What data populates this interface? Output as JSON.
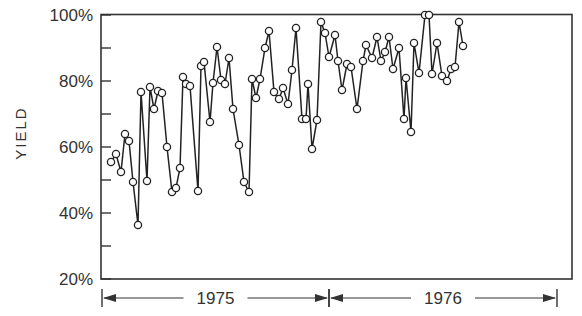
{
  "chart_data": {
    "type": "line",
    "title": "",
    "xlabel": "",
    "ylabel": "YIELD",
    "ylim": [
      20,
      100
    ],
    "yticks": [
      "20%",
      "40%",
      "60%",
      "80%",
      "100%"
    ],
    "x_periods": [
      {
        "label": "1975",
        "start_px": 102,
        "end_px": 329
      },
      {
        "label": "1976",
        "start_px": 329,
        "end_px": 557
      }
    ],
    "grid": false,
    "legend": "none",
    "marker": "open-circle",
    "series": [
      {
        "name": "Yield",
        "points_px": [
          [
            111,
            162
          ],
          [
            116,
            154
          ],
          [
            121,
            172
          ],
          [
            125,
            134
          ],
          [
            129,
            141
          ],
          [
            133,
            182
          ],
          [
            138,
            225
          ],
          [
            141,
            92
          ],
          [
            147,
            181
          ],
          [
            150,
            87
          ],
          [
            154,
            109
          ],
          [
            158,
            91
          ],
          [
            162,
            93
          ],
          [
            167,
            147
          ],
          [
            172,
            192
          ],
          [
            176,
            188
          ],
          [
            180,
            168
          ],
          [
            183,
            77
          ],
          [
            186,
            84
          ],
          [
            190,
            86
          ],
          [
            198,
            191
          ],
          [
            201,
            66
          ],
          [
            204,
            62
          ],
          [
            210,
            122
          ],
          [
            213,
            83
          ],
          [
            217,
            47
          ],
          [
            221,
            80
          ],
          [
            225,
            84
          ],
          [
            229,
            58
          ],
          [
            233,
            109
          ],
          [
            239,
            145
          ],
          [
            244,
            182
          ],
          [
            249,
            192
          ],
          [
            252,
            79
          ],
          [
            256,
            98
          ],
          [
            260,
            79
          ],
          [
            265,
            48
          ],
          [
            269,
            31
          ],
          [
            274,
            92
          ],
          [
            279,
            99
          ],
          [
            283,
            88
          ],
          [
            288,
            104
          ],
          [
            292,
            70
          ],
          [
            296,
            28
          ],
          [
            302,
            119
          ],
          [
            306,
            119
          ],
          [
            308,
            84
          ],
          [
            312,
            149
          ],
          [
            317,
            120
          ],
          [
            321,
            22
          ],
          [
            325,
            33
          ],
          [
            329,
            57
          ],
          [
            335,
            35
          ],
          [
            338,
            61
          ],
          [
            342,
            90
          ],
          [
            347,
            64
          ],
          [
            351,
            67
          ],
          [
            357,
            109
          ],
          [
            363,
            61
          ],
          [
            366,
            45
          ],
          [
            372,
            58
          ],
          [
            377,
            37
          ],
          [
            381,
            61
          ],
          [
            385,
            52
          ],
          [
            389,
            37
          ],
          [
            393,
            69
          ],
          [
            399,
            48
          ],
          [
            404,
            119
          ],
          [
            406,
            78
          ],
          [
            411,
            132
          ],
          [
            414,
            43
          ],
          [
            419,
            73
          ],
          [
            425,
            15
          ],
          [
            429,
            15
          ],
          [
            432,
            74
          ],
          [
            437,
            43
          ],
          [
            442,
            76
          ],
          [
            447,
            81
          ],
          [
            451,
            69
          ],
          [
            455,
            67
          ],
          [
            459,
            22
          ],
          [
            463,
            46
          ]
        ],
        "values": [
          55.5,
          58,
          52.5,
          64,
          62,
          49.5,
          36.5,
          76.5,
          49.5,
          78,
          71.5,
          77,
          76.5,
          60,
          46.5,
          47.5,
          53.5,
          81,
          79,
          78,
          46.5,
          84.5,
          86,
          67.5,
          79,
          90,
          80,
          79,
          86.5,
          71,
          60,
          49,
          46,
          79.5,
          74,
          79.5,
          89,
          94,
          76,
          74,
          77,
          72.5,
          82,
          95,
          67.5,
          67.5,
          78,
          58,
          67,
          97.5,
          94,
          86.5,
          93,
          85.5,
          76.5,
          84.5,
          84,
          72,
          85.5,
          90,
          86.5,
          93,
          85.5,
          88.5,
          93,
          83.5,
          90,
          67.5,
          80,
          64,
          91.5,
          82.5,
          100,
          100,
          82,
          91.5,
          81.5,
          80,
          83.5,
          84,
          97.5,
          90.5
        ]
      }
    ]
  },
  "axes": {
    "ylabel": "YIELD",
    "yticks": [
      {
        "label": "100%",
        "y": 15
      },
      {
        "label": "80%",
        "y": 81
      },
      {
        "label": "60%",
        "y": 147
      },
      {
        "label": "40%",
        "y": 213
      },
      {
        "label": "20%",
        "y": 279
      }
    ],
    "periods": [
      "1975",
      "1976"
    ]
  }
}
